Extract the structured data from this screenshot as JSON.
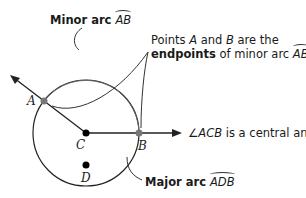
{
  "labels": {
    "minor_arc_prefix": "Minor arc ",
    "minor_arc_name": "AB",
    "endpoints_line1": "Points ",
    "endpoints_A": "A",
    "endpoints_and": " and ",
    "endpoints_B": "B",
    "endpoints_are": " are the",
    "endpoints_bold": "endpoints",
    "endpoints_of": " of minor arc ",
    "endpoints_arc": "AB",
    "endpoints_period": ".",
    "central_angle_symbol": "∠",
    "central_angle_name": "ACB",
    "central_angle_text": " is a central angle.",
    "major_arc_prefix": "Major arc ",
    "major_arc_name": "ADB"
  },
  "points": {
    "A": "A",
    "B": "B",
    "C": "C",
    "D": "D"
  },
  "colors": {
    "stroke": "#222222",
    "highlight_point": "#777777",
    "thin_arc": "#555555"
  }
}
